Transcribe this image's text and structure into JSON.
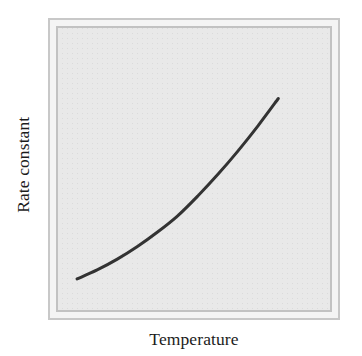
{
  "chart_data": {
    "type": "line",
    "title": "",
    "subtitle": "",
    "xlabel": "Temperature",
    "ylabel": "Rate constant",
    "grid": false,
    "legend": null,
    "legend_position": "none",
    "annotations": [],
    "x_tick_labels": [],
    "y_tick_labels": [],
    "xlim": [
      0,
      1
    ],
    "ylim": [
      0,
      1
    ],
    "series": [
      {
        "name": "rate constant",
        "color": "#333333",
        "line_width": 3,
        "x": [
          0.0,
          0.1,
          0.2,
          0.3,
          0.4,
          0.5,
          0.6,
          0.7,
          0.8,
          0.9,
          1.0
        ],
        "y": [
          0.0,
          0.05,
          0.11,
          0.18,
          0.26,
          0.35,
          0.46,
          0.58,
          0.71,
          0.85,
          1.0
        ]
      }
    ]
  },
  "figure": {
    "background_color": "#ffffff",
    "plot_background_color": "#e9e9e9",
    "frame_outer_color": "#c8c8c8",
    "frame_inner_color": "#c2c2c2",
    "curve_color": "#333333",
    "label_color": "#1c1c1c"
  },
  "axes": {
    "x_label": "Temperature",
    "y_label": "Rate constant"
  }
}
